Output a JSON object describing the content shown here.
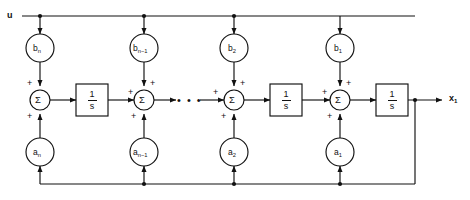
{
  "diagram": {
    "input_port": {
      "label": "u",
      "name": "input-u"
    },
    "output_port": {
      "label": "x",
      "sub": "1",
      "name": "output-x1"
    },
    "ellipsis": "• • •",
    "stroke_color": "#111111",
    "background_color": "#ffffff",
    "feedforward_gains": [
      {
        "id": "b-n",
        "base": "b",
        "sub": "n",
        "x": 40,
        "y": 48
      },
      {
        "id": "b-n-1",
        "base": "b",
        "sub": "n−1",
        "x": 144,
        "y": 48
      },
      {
        "id": "b-2",
        "base": "b",
        "sub": "2",
        "x": 234,
        "y": 48
      },
      {
        "id": "b-1",
        "base": "b",
        "sub": "1",
        "x": 340,
        "y": 48
      }
    ],
    "feedback_gains": [
      {
        "id": "a-n",
        "base": "a",
        "sub": "n",
        "x": 40,
        "y": 152
      },
      {
        "id": "a-n-1",
        "base": "a",
        "sub": "n−1",
        "x": 144,
        "y": 152
      },
      {
        "id": "a-2",
        "base": "a",
        "sub": "2",
        "x": 234,
        "y": 152
      },
      {
        "id": "a-1",
        "base": "a",
        "sub": "1",
        "x": 340,
        "y": 152
      }
    ],
    "summers": [
      {
        "id": "sum-n",
        "symbol": "Σ",
        "x": 40,
        "y": 100,
        "signs": [
          "+",
          "+"
        ]
      },
      {
        "id": "sum-n-1",
        "symbol": "Σ",
        "x": 144,
        "y": 100,
        "signs": [
          "+",
          "+",
          "+"
        ]
      },
      {
        "id": "sum-2",
        "symbol": "Σ",
        "x": 234,
        "y": 100,
        "signs": [
          "+",
          "+",
          "+"
        ]
      },
      {
        "id": "sum-1",
        "symbol": "Σ",
        "x": 340,
        "y": 100,
        "signs": [
          "+",
          "+",
          "+"
        ]
      }
    ],
    "integrators": [
      {
        "id": "integrator-1",
        "numerator": "1",
        "denominator": "s",
        "x": 92,
        "y": 100
      },
      {
        "id": "integrator-2",
        "numerator": "1",
        "denominator": "s",
        "x": 286,
        "y": 100
      },
      {
        "id": "integrator-3",
        "numerator": "1",
        "denominator": "s",
        "x": 392,
        "y": 100
      }
    ],
    "rails": {
      "top_y": 16,
      "bottom_y": 184,
      "main_y": 100,
      "feedback_tap_x": 415
    }
  }
}
